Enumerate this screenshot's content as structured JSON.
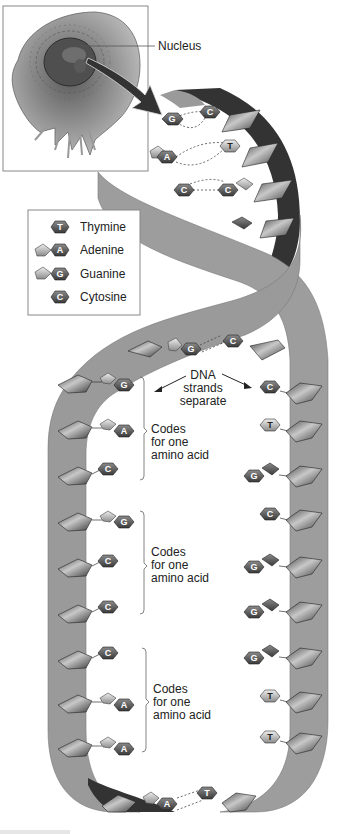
{
  "figure": {
    "callout_nucleus": "Nucleus",
    "annotation_separate": [
      "DNA",
      "strands",
      "separate"
    ],
    "codon_labels": [
      [
        "Codes",
        "for one",
        "amino acid"
      ],
      [
        "Codes",
        "for one",
        "amino acid"
      ],
      [
        "Codes",
        "for one",
        "amino acid"
      ]
    ]
  },
  "legend": {
    "items": [
      {
        "letter": "T",
        "label": "Thymine"
      },
      {
        "letter": "A",
        "label": "Adenine"
      },
      {
        "letter": "G",
        "label": "Guanine"
      },
      {
        "letter": "C",
        "label": "Cytosine"
      }
    ]
  },
  "helix_pairs": [
    {
      "left": "G",
      "right": "C"
    },
    {
      "left": "A",
      "right": "T"
    },
    {
      "left": "C",
      "right": "G"
    },
    {
      "left": "G",
      "right": "C"
    }
  ],
  "left_strand": [
    "G",
    "A",
    "C",
    "G",
    "C",
    "C",
    "C",
    "A",
    "A"
  ],
  "right_strand": [
    "C",
    "T",
    "G",
    "C",
    "G",
    "G",
    "G",
    "T",
    "T"
  ],
  "bottom_pair": {
    "left": "A",
    "right": "T"
  },
  "colors": {
    "strand_light": "#9a9a9a",
    "strand_dark": "#3a3a3a",
    "sugar_fill": "#6e6e6e",
    "base_dark": "#555555",
    "base_light": "#bdbdbd",
    "background": "#ffffff"
  }
}
